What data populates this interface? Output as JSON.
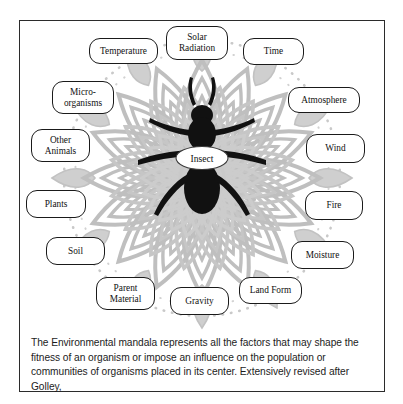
{
  "page": {
    "ghost_header": "",
    "insect_label": "Insect",
    "caption": "The Environmental mandala represents all the factors that may shape the fitness of an organism or impose an influence on the population or communities of organisms placed in its center. Extensively revised after Golley,"
  },
  "colors": {
    "mandala": "#bfbfbf",
    "mandala_light": "#d6d6d6",
    "insect": "#111111",
    "frame": "#2b2b2b",
    "box_border": "#1a1a1a",
    "background": "#ffffff"
  },
  "nodes": [
    {
      "id": "temperature",
      "label": "Temperature",
      "lines": [
        "Temperature"
      ]
    },
    {
      "id": "solar-radiation",
      "label": "Solar Radiation",
      "lines": [
        "Solar",
        "Radiation"
      ]
    },
    {
      "id": "time",
      "label": "Time",
      "lines": [
        "Time"
      ]
    },
    {
      "id": "micro-organisms",
      "label": "Micro-organisms",
      "lines": [
        "Micro-",
        "organisms"
      ]
    },
    {
      "id": "atmosphere",
      "label": "Atmosphere",
      "lines": [
        "Atmosphere"
      ]
    },
    {
      "id": "other-animals",
      "label": "Other Animals",
      "lines": [
        "Other",
        "Animals"
      ]
    },
    {
      "id": "wind",
      "label": "Wind",
      "lines": [
        "Wind"
      ]
    },
    {
      "id": "plants",
      "label": "Plants",
      "lines": [
        "Plants"
      ]
    },
    {
      "id": "fire",
      "label": "Fire",
      "lines": [
        "Fire"
      ]
    },
    {
      "id": "soil",
      "label": "Soil",
      "lines": [
        "Soil"
      ]
    },
    {
      "id": "moisture",
      "label": "Moisture",
      "lines": [
        "Moisture"
      ]
    },
    {
      "id": "parent-material",
      "label": "Parent Material",
      "lines": [
        "Parent",
        "Material"
      ]
    },
    {
      "id": "gravity",
      "label": "Gravity",
      "lines": [
        "Gravity"
      ]
    },
    {
      "id": "land-form",
      "label": "Land Form",
      "lines": [
        "Land Form"
      ]
    }
  ]
}
